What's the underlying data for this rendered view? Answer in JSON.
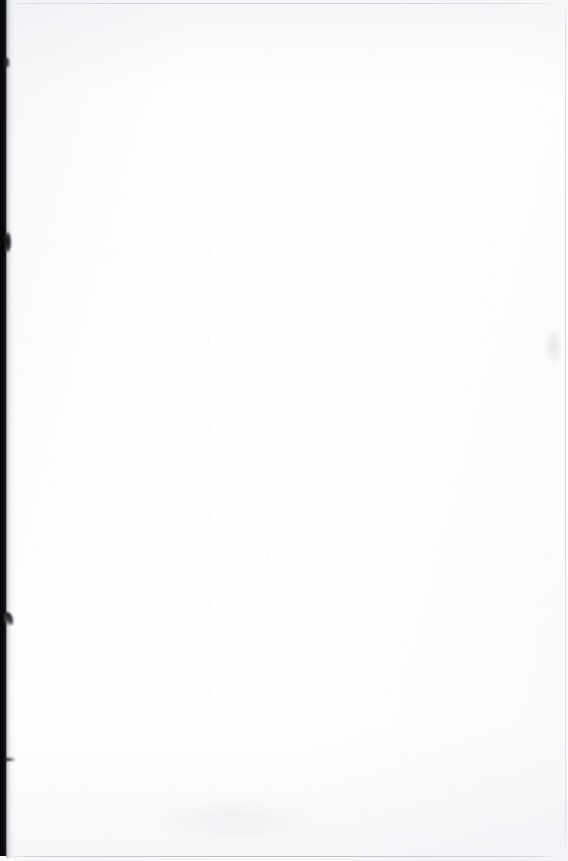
{
  "page": {
    "kind": "scanned-document-page",
    "content_state": "blank",
    "visible_text": "",
    "width_px": 568,
    "height_px": 861,
    "background_color": "#fefefe",
    "paper_tone_color": "#f7f8fa"
  },
  "artifacts": {
    "left_scan_border": {
      "name": "dark scan border",
      "color": "#0a0a0c",
      "edge_fade_color": "#7a7e85"
    },
    "edge_marks": [
      {
        "name": "upper edge nick",
        "color": "#0a0b0d"
      },
      {
        "name": "upper edge blob",
        "color": "#0b0b0d"
      },
      {
        "name": "mid edge notch",
        "color": "#0d0e10"
      },
      {
        "name": "lower edge tick",
        "color": "#0c0d0f"
      }
    ],
    "rules": [
      {
        "name": "top rule",
        "color": "#bac0c5"
      },
      {
        "name": "bottom rule",
        "color": "#a6aab2"
      },
      {
        "name": "right rule",
        "color": "#c0c4cb"
      }
    ],
    "smudges": [
      {
        "name": "right margin smudge",
        "color": "#afb3ba"
      },
      {
        "name": "lower left smudge",
        "color": "#c6c9cf"
      }
    ]
  }
}
